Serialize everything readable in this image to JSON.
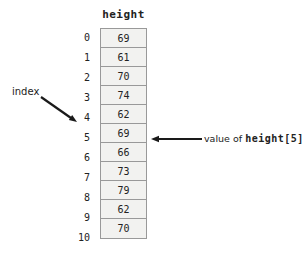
{
  "diagram": {
    "array_name": "height",
    "index_label": "index",
    "value_label_plain": "value of ",
    "value_label_code": "height[5]",
    "rows": [
      {
        "index": "0",
        "value": "69"
      },
      {
        "index": "1",
        "value": "61"
      },
      {
        "index": "2",
        "value": "70"
      },
      {
        "index": "3",
        "value": "74"
      },
      {
        "index": "4",
        "value": "62"
      },
      {
        "index": "5",
        "value": "69"
      },
      {
        "index": "6",
        "value": "66"
      },
      {
        "index": "7",
        "value": "73"
      },
      {
        "index": "8",
        "value": "79"
      },
      {
        "index": "9",
        "value": "62"
      },
      {
        "index": "10",
        "value": "70"
      }
    ],
    "colors": {
      "cell_fill": "#f2f2f0",
      "cell_border": "#999999",
      "text": "#222222",
      "arrow": "#1a1a1a"
    }
  }
}
